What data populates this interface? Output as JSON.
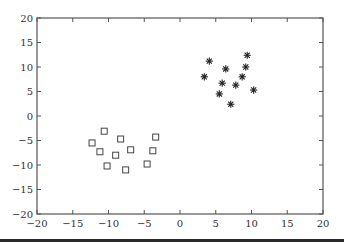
{
  "chart_data": {
    "type": "scatter",
    "title": "",
    "xlabel": "",
    "ylabel": "",
    "xlim": [
      -20,
      20
    ],
    "ylim": [
      -20,
      20
    ],
    "grid": false,
    "legend": null,
    "xticks": [
      -20,
      -15,
      -10,
      -5,
      0,
      5,
      10,
      15,
      20
    ],
    "yticks": [
      -20,
      -15,
      -10,
      -5,
      0,
      5,
      10,
      15,
      20
    ],
    "xtick_labels": [
      "−20",
      "−15",
      "−10",
      "−5",
      "0",
      "5",
      "10",
      "15",
      "20"
    ],
    "ytick_labels": [
      "−20",
      "−15",
      "−10",
      "−5",
      "0",
      "5",
      "10",
      "15",
      "20"
    ],
    "series": [
      {
        "name": "class-square",
        "marker": "square-open",
        "color": "#444444",
        "x": [
          -12.3,
          -10.6,
          -11.2,
          -10.2,
          -9.0,
          -8.3,
          -7.6,
          -6.9,
          -4.6,
          -3.8,
          -3.4
        ],
        "y": [
          -5.5,
          -3.1,
          -7.3,
          -10.2,
          -8.0,
          -4.7,
          -11.0,
          -6.9,
          -9.8,
          -7.1,
          -4.3
        ]
      },
      {
        "name": "class-star",
        "marker": "asterisk",
        "color": "#222222",
        "x": [
          3.4,
          4.1,
          5.5,
          5.9,
          6.4,
          7.1,
          7.8,
          8.7,
          9.2,
          9.4,
          10.3
        ],
        "y": [
          8.0,
          11.2,
          4.5,
          6.7,
          9.6,
          2.4,
          6.3,
          8.0,
          10.0,
          12.4,
          5.3
        ]
      }
    ]
  },
  "colors": {
    "axis": "#555555",
    "text": "#333333",
    "background": "#ffffff"
  }
}
